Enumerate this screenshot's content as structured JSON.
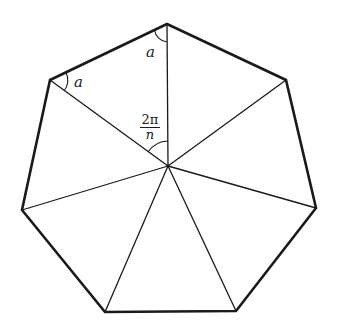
{
  "diagram": {
    "shape": "regular polygon",
    "sides": 7,
    "vertices": [
      {
        "id": "v0",
        "x": 167,
        "y": 24
      },
      {
        "id": "v1",
        "x": 286,
        "y": 80
      },
      {
        "id": "v2",
        "x": 316,
        "y": 208
      },
      {
        "id": "v3",
        "x": 236,
        "y": 311
      },
      {
        "id": "v4",
        "x": 105,
        "y": 312
      },
      {
        "id": "v5",
        "x": 22,
        "y": 210
      },
      {
        "id": "v6",
        "x": 50,
        "y": 80
      }
    ],
    "center": {
      "x": 168,
      "y": 166
    },
    "labels": {
      "angle_top": "a",
      "angle_left": "a",
      "central_angle_numerator": "2π",
      "central_angle_denominator": "n"
    },
    "colors": {
      "stroke": "#1a1a1a",
      "background": "#ffffff"
    }
  }
}
